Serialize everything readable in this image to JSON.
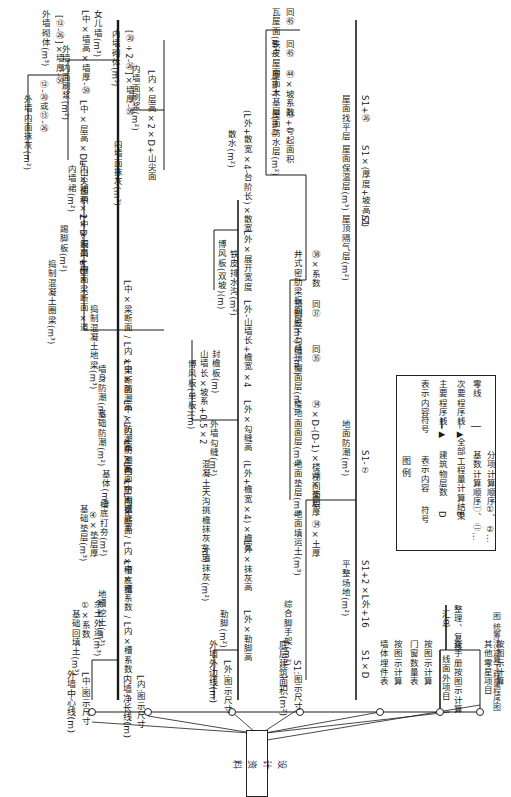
{
  "figure": {
    "orientation": "rotated 90° clockwise (landscape flowchart shown in portrait)",
    "caption": "图 统筹法计算工程量程序图"
  },
  "source_box": {
    "label": "设计资料"
  },
  "base_lines": [
    {
      "id": "1",
      "name": "外墙中心线(m)",
      "formula": "L中:图示尺寸"
    },
    {
      "id": "2",
      "name": "内墙净长线(m)",
      "formula": "L内:图示尺寸"
    },
    {
      "id": "3",
      "name": "外墙外边线(m)",
      "formula": "L外:图示尺寸"
    },
    {
      "id": "4",
      "name": "底层建筑面积(m²)",
      "formula": "S1:图示尺寸"
    }
  ],
  "branch_foundation": [
    {
      "node": "1",
      "name": "地槽挖土(m³)",
      "formula": "L中×槽系数 / L内×槽系数"
    },
    {
      "node": "2",
      "name": "基础回填土(m³)",
      "formula": "①×系数"
    },
    {
      "node": "3",
      "name": "余土外运(m³)",
      "formula": "①-②③④"
    },
    {
      "node": "5",
      "name": "基础垫层(m³)",
      "formula": "④×垫层厚"
    },
    {
      "node": "4",
      "name": "槽底打夯(m²)",
      "formula": "L中×槽底宽 / L内×槽底宽"
    },
    {
      "node": "6",
      "name": "基体(m³)",
      "formula": "L中×断面 / L内×断面"
    },
    {
      "node": "7",
      "name": "基础防潮(m²)",
      "formula": "L中×防潮宽 / L内×防潮宽"
    },
    {
      "node": "8",
      "name": "墙身防潮(m²)",
      "formula": "L中×防潮高 / L内×防潮高"
    },
    {
      "node": "9",
      "name": "捣制混凝土地梁(m³)",
      "formula": "L中×梁断面 / L内×梁断面"
    },
    {
      "node": "10",
      "name": "捣制混凝土圈梁(m³)",
      "formula": "L中×梁断面×道"
    },
    {
      "node": "11",
      "name": "踢脚板(m²)",
      "formula": "L中×板高×D"
    },
    {
      "node": "12",
      "name": "外墙砌体(m³)",
      "formula": "L中×墙高×墙厚-㊿"
    },
    {
      "node": "13",
      "name": "外墙内面抹灰(m²)",
      "formula": "⑫-⑳或⑬-㉖"
    },
    {
      "node": "14",
      "name": "外墙内面刷浆(m²)",
      "formula": "L中×层高×D+山尖面积"
    },
    {
      "node": "15",
      "name": "外墙砌体(m³)",
      "formula": "[⑫-㉖]×墙厚-㊿"
    },
    {
      "node": "16",
      "name": "女儿墙(m³)",
      "formula": "L中×墙高×墙厚-㊿"
    },
    {
      "node": "17",
      "name": "捣制混凝土圈梁(m³)",
      "formula": "L内×梁断面×道"
    },
    {
      "node": "18",
      "name": "踢脚板(m²)",
      "formula": "L内×板高×D"
    },
    {
      "node": "19",
      "name": "内墙裙(m²)",
      "formula": "L内×裙高×2×D-洞口+侧面"
    },
    {
      "node": "20",
      "name": "内墙面抹灰(m²)",
      "formula": "⑲-⑳或⑲-㉖×2"
    },
    {
      "node": "21",
      "name": "内墙面刷浆(m²)",
      "formula": "L内×层高×2×D+山尖面"
    },
    {
      "node": "22",
      "name": "内墙砌体(m³)",
      "formula": "[⑳÷2-㉖]×墙厚-㊿"
    }
  ],
  "branch_outer": [
    {
      "node": "23",
      "name": "勒脚(m²)",
      "formula": "L外×勒脚高"
    },
    {
      "node": "24",
      "name": "外墙抹灰(m²)",
      "formula": "L外×抹灰高"
    },
    {
      "node": "25",
      "name": "混凝土天沟挑檐抹灰(m²)",
      "formula": "(L外+檐宽×4)×檐宽"
    },
    {
      "node": "26",
      "name": "外墙勾缝(m²)",
      "formula": "L外×勾缝高"
    },
    {
      "node": "27",
      "name": "博风板(单板)(m)",
      "formula": "山墙长×坡系+0.5×2"
    },
    {
      "node": "28",
      "name": "封檐板(m)",
      "formula": "L外-山墙长+檐宽×4"
    },
    {
      "node": "29",
      "name": "博风板(双坡)(m)",
      "formula": "㉘+0.5×2"
    },
    {
      "node": "30",
      "name": "铁皮排水沟(m²)",
      "formula": "L外×展开宽度"
    },
    {
      "node": "31",
      "name": "散水(m²)",
      "formula": "(L外+散宽×4-台阶长)×散宽"
    }
  ],
  "branch_floor": [
    {
      "node": "32",
      "name": "综合脚手架(m²)",
      "formula": "S1×D"
    },
    {
      "node": "33",
      "name": "平整场地(m²)",
      "formula": "S1+2×L外+16"
    },
    {
      "node": "34",
      "name": "地面填运土(m³)",
      "formula": "㉞×土厚"
    },
    {
      "node": "35",
      "name": "地面垫层(m³)",
      "formula": "㉞×垫层厚"
    },
    {
      "node": "36",
      "name": "楼地面面层(m²)",
      "formula": "㉞×D-(D-1)×楼梯间面积"
    },
    {
      "node": "37",
      "name": "吊顶棚面层(m²)",
      "formula": "同㉟"
    },
    {
      "node": "38",
      "name": "预制板下勾缝(m²)",
      "formula": "同㊲"
    },
    {
      "node": "39",
      "name": "井式密肋梁板面层(m²)",
      "formula": "㊳×系数"
    },
    {
      "node": "40",
      "name": "地面防潮(m²)",
      "formula": "S1-⑦"
    },
    {
      "node": "41",
      "name": "屋顶隔气层(m²)",
      "formula": "S1"
    },
    {
      "node": "42",
      "name": "屋面保温层(m³)",
      "formula": "S1×(厚度+坡高/2)"
    },
    {
      "node": "43",
      "name": "屋面找平层",
      "formula": "S1+㉖"
    },
    {
      "node": "44",
      "name": "屋面防水层(m²)",
      "formula": "㊸+夸起面积"
    },
    {
      "node": "45",
      "name": "屋面木基层(m²)",
      "formula": "㊹×坡系数"
    },
    {
      "node": "46",
      "name": "铁皮屋面(m²)",
      "formula": "同㊺"
    },
    {
      "node": "47",
      "name": "瓦屋面(m²)",
      "formula": "同㊺"
    }
  ],
  "branch_other": [
    {
      "node": "一",
      "name": "墙体埋件表",
      "formula": "按图示计算"
    },
    {
      "node": "二",
      "name": "门窗数量表",
      "formula": "按图示计算"
    },
    {
      "node": "三",
      "name": "线面外项目",
      "formula": "查手册按图示计算"
    },
    {
      "node": "四",
      "name": "其他零星项目",
      "formula": "按图示计算"
    },
    {
      "node": "五",
      "name": "汇总",
      "formula": "整理、复核"
    }
  ],
  "legend": {
    "title": "图 例",
    "headers": [
      "符号",
      "表示内容",
      "符号",
      "表示内容"
    ],
    "rows": [
      [
        "D",
        "建筑物层数",
        "━━▶",
        "主要程序线"
      ],
      [
        "E",
        "全部工程量计算结束",
        "──▶",
        "次要程序线"
      ],
      [
        "㊀、㊁…",
        "基数计算顺序",
        "│",
        "零线"
      ],
      [
        "①、②…",
        "分项计算顺序",
        "",
        ""
      ]
    ]
  }
}
